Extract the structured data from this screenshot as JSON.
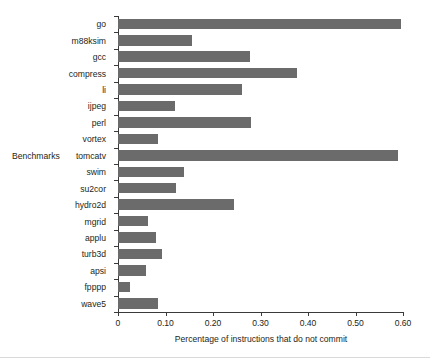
{
  "chart_data": {
    "type": "bar",
    "orientation": "horizontal",
    "title": "",
    "xlabel": "Percentage of instructions that do not commit",
    "ylabel": "Benchmarks",
    "xlim": [
      0,
      0.6
    ],
    "xticks": [
      "0",
      "0.10",
      "0.20",
      "0.30",
      "0.40",
      "0.50",
      "0.60"
    ],
    "xtick_values": [
      0,
      0.1,
      0.2,
      0.3,
      0.4,
      0.5,
      0.6
    ],
    "grid": false,
    "legend": null,
    "bar_color": "#6b6b6b",
    "axis_color": "#3a3a3a",
    "categories": [
      "go",
      "m88ksim",
      "gcc",
      "compress",
      "li",
      "ijpeg",
      "perl",
      "vortex",
      "tomcatv",
      "swim",
      "su2cor",
      "hydro2d",
      "mgrid",
      "applu",
      "turb3d",
      "apsi",
      "fpppp",
      "wave5"
    ],
    "values": [
      0.595,
      0.155,
      0.277,
      0.377,
      0.262,
      0.12,
      0.281,
      0.084,
      0.59,
      0.139,
      0.122,
      0.245,
      0.064,
      0.079,
      0.092,
      0.059,
      0.026,
      0.085
    ]
  }
}
